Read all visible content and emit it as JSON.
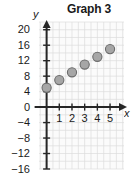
{
  "chart": {
    "title": "Graph 3",
    "x_axis_name": "x",
    "y_axis_name": "y"
  },
  "chart_data": {
    "type": "scatter",
    "title": "Graph 3",
    "xlabel": "x",
    "ylabel": "y",
    "x": [
      0,
      1,
      2,
      3,
      4,
      5
    ],
    "values": [
      5,
      7,
      9,
      11,
      13,
      15
    ],
    "points": [
      {
        "x": 0,
        "y": 5
      },
      {
        "x": 1,
        "y": 7
      },
      {
        "x": 2,
        "y": 9
      },
      {
        "x": 3,
        "y": 11
      },
      {
        "x": 4,
        "y": 13
      },
      {
        "x": 5,
        "y": 15
      }
    ],
    "xlim": [
      -0.6,
      6.1
    ],
    "ylim": [
      -16,
      22
    ],
    "x_ticks": [
      1,
      2,
      3,
      4,
      5
    ],
    "x_tick_labels": [
      "1",
      "2",
      "3",
      "4",
      "5"
    ],
    "y_ticks": [
      20,
      16,
      12,
      8,
      4,
      0,
      -4,
      -8,
      -12,
      -16
    ],
    "y_tick_labels": [
      "20",
      "16",
      "12",
      "8",
      "4",
      "0",
      "−4",
      "−8",
      "−12",
      "−16"
    ],
    "grid": true,
    "grid_spacing": 1,
    "legend": null,
    "marker_color": "#a6a6a6",
    "marker_edge_color": "#6b6b6b",
    "axis_color": "#262626",
    "grid_color": "#dcdcdc",
    "plot_background": "#fbfbfb"
  }
}
